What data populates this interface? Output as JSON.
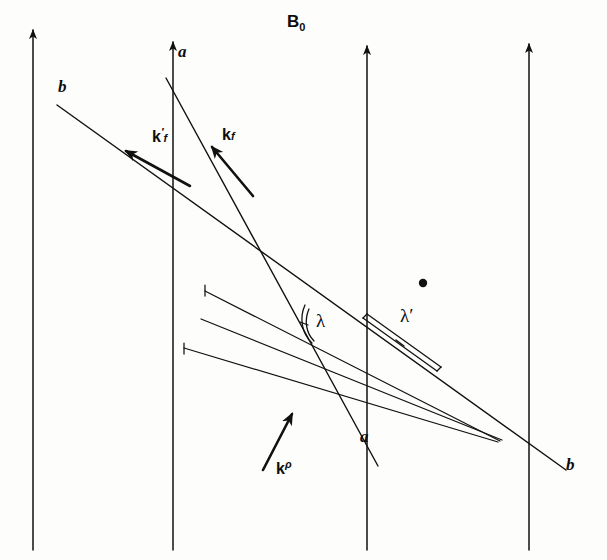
{
  "figure": {
    "type": "scientific-line-diagram",
    "background_color": "#fdfdfc",
    "ink_color": "#111111"
  },
  "labels": {
    "field_label": "B",
    "field_subscript": "0",
    "k_final_prime_base": "k",
    "k_final_prime_mark": "′",
    "k_final_prime_sub": "f",
    "k_final_base": "k",
    "k_final_sub": "f",
    "k_incident_base": "k",
    "k_incident_sup": "ρ",
    "lambda": "λ",
    "lambda_prime": "λ′",
    "line_a_top": "a",
    "line_a_bottom": "a",
    "line_b_top": "b",
    "line_b_bottom": "b"
  },
  "geometry": {
    "field_arrows_x": [
      33,
      173,
      367,
      529
    ],
    "field_arrow_top_y": 25,
    "field_arrow_bottom_y": 550,
    "line_a": {
      "x1": 166,
      "y1": 78,
      "x2": 378,
      "y2": 466
    },
    "line_b": {
      "x1": 57,
      "y1": 105,
      "x2": 566,
      "y2": 470
    },
    "lattice_planes": [
      {
        "x1": 205,
        "y1": 291,
        "x2": 500,
        "y2": 441
      },
      {
        "x1": 201,
        "y1": 319,
        "x2": 502,
        "y2": 440
      },
      {
        "x1": 184,
        "y1": 348,
        "x2": 498,
        "y2": 442
      }
    ],
    "scatter_point": {
      "x": 423,
      "y": 283,
      "r": 4
    },
    "k_prime_arrow": {
      "x1": 190,
      "y1": 186,
      "x2": 122,
      "y2": 148
    },
    "k_arrow": {
      "x1": 253,
      "y1": 196,
      "x2": 209,
      "y2": 143
    },
    "k_rho_arrow": {
      "x1": 263,
      "y1": 470,
      "x2": 293,
      "y2": 409
    }
  },
  "label_positions": {
    "field": {
      "x": 287,
      "y": 20
    },
    "k_prime": {
      "x": 152,
      "y": 130
    },
    "k_final": {
      "x": 221,
      "y": 130
    },
    "k_rho": {
      "x": 275,
      "y": 462
    },
    "lambda": {
      "x": 316,
      "y": 322
    },
    "lambda_prime": {
      "x": 400,
      "y": 317
    },
    "a_top": {
      "x": 178,
      "y": 48
    },
    "a_bottom": {
      "x": 360,
      "y": 434
    },
    "b_top": {
      "x": 58,
      "y": 84
    },
    "b_bottom": {
      "x": 566,
      "y": 462
    }
  }
}
